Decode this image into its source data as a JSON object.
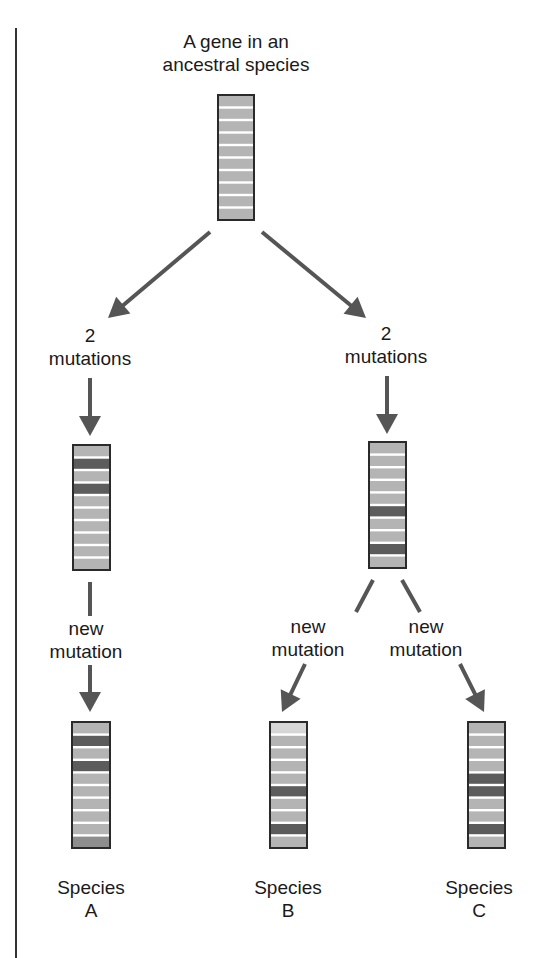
{
  "title": {
    "line1": "A gene in an",
    "line2": "ancestral species"
  },
  "colors": {
    "segment_normal": "#b4b4b4",
    "segment_mutated": "#5c5c5c",
    "segment_light": "#d6d6d6",
    "separator": "#ffffff",
    "outline": "#2a2a2a",
    "arrow": "#555555"
  },
  "labels": {
    "left_two_mutations": {
      "line1": "2",
      "line2": "mutations"
    },
    "right_two_mutations": {
      "line1": "2",
      "line2": "mutations"
    },
    "left_new_mutation": {
      "line1": "new",
      "line2": "mutation"
    },
    "mid_new_mutation": {
      "line1": "new",
      "line2": "mutation"
    },
    "right_new_mutation": {
      "line1": "new",
      "line2": "mutation"
    }
  },
  "genes": [
    {
      "id": "ancestral",
      "x": 218,
      "y": 95,
      "w": 36,
      "h": 125,
      "segments": [
        "n",
        "n",
        "n",
        "n",
        "n",
        "n",
        "n",
        "n",
        "n",
        "n"
      ]
    },
    {
      "id": "left-intermediate",
      "x": 73,
      "y": 445,
      "w": 37,
      "h": 125,
      "segments": [
        "n",
        "m",
        "n",
        "m",
        "n",
        "n",
        "n",
        "n",
        "n",
        "n"
      ]
    },
    {
      "id": "right-intermediate",
      "x": 369,
      "y": 442,
      "w": 37,
      "h": 126,
      "segments": [
        "n",
        "n",
        "n",
        "n",
        "n",
        "m",
        "n",
        "n",
        "m",
        "n"
      ]
    },
    {
      "id": "species-a",
      "x": 72,
      "y": 722,
      "w": 38,
      "h": 126,
      "segments": [
        "n",
        "m",
        "n",
        "m",
        "n",
        "n",
        "n",
        "n",
        "n",
        "d"
      ]
    },
    {
      "id": "species-b",
      "x": 270,
      "y": 722,
      "w": 37,
      "h": 126,
      "segments": [
        "l",
        "n",
        "n",
        "n",
        "n",
        "m",
        "n",
        "n",
        "m",
        "n"
      ]
    },
    {
      "id": "species-c",
      "x": 468,
      "y": 722,
      "w": 37,
      "h": 126,
      "segments": [
        "n",
        "n",
        "n",
        "n",
        "m",
        "m",
        "n",
        "n",
        "m",
        "n"
      ]
    }
  ],
  "species": [
    {
      "line1": "Species",
      "line2": "A"
    },
    {
      "line1": "Species",
      "line2": "B"
    },
    {
      "line1": "Species",
      "line2": "C"
    }
  ],
  "arrows": [
    {
      "id": "ancestral-to-left",
      "x1": 210,
      "y1": 232,
      "x2": 108,
      "y2": 318,
      "head": true
    },
    {
      "id": "ancestral-to-right",
      "x1": 262,
      "y1": 232,
      "x2": 366,
      "y2": 318,
      "head": true
    },
    {
      "id": "left-mutations-to-gene",
      "x1": 90,
      "y1": 378,
      "x2": 90,
      "y2": 436,
      "head": true
    },
    {
      "id": "right-mutations-to-gene",
      "x1": 387,
      "y1": 376,
      "x2": 387,
      "y2": 434,
      "head": true
    },
    {
      "id": "left-gene-stem",
      "x1": 90,
      "y1": 582,
      "x2": 90,
      "y2": 616,
      "head": false
    },
    {
      "id": "left-new-to-species-a",
      "x1": 90,
      "y1": 665,
      "x2": 90,
      "y2": 712,
      "head": true
    },
    {
      "id": "right-gene-stem-to-b",
      "x1": 373,
      "y1": 580,
      "x2": 356,
      "y2": 612,
      "head": false
    },
    {
      "id": "right-new-to-species-b",
      "x1": 305,
      "y1": 664,
      "x2": 282,
      "y2": 712,
      "head": true
    },
    {
      "id": "right-gene-stem-to-c",
      "x1": 402,
      "y1": 580,
      "x2": 420,
      "y2": 612,
      "head": false
    },
    {
      "id": "right-new-to-species-c",
      "x1": 460,
      "y1": 664,
      "x2": 484,
      "y2": 712,
      "head": true
    }
  ]
}
